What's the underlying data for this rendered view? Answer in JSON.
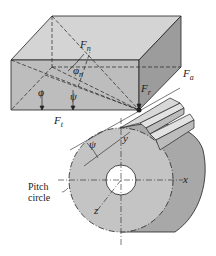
{
  "figure": {
    "type": "helical gear force components diagram",
    "labels": {
      "normal_force": {
        "main": "F",
        "sub": "n"
      },
      "axial_force": {
        "main": "F",
        "sub": "a"
      },
      "radial_force": {
        "main": "F",
        "sub": "r"
      },
      "tangential_force": {
        "main": "F",
        "sub": "t"
      },
      "normal_pressure_angle": {
        "main": "φ",
        "sub": "n"
      },
      "pressure_angle": "φ",
      "helix_angle_box": "ψ",
      "helix_angle_gear": "ψ",
      "axis_x": "x",
      "axis_y": "y",
      "axis_z": "z",
      "pitch_circle_line1": "Pitch",
      "pitch_circle_line2": "circle"
    },
    "colors": {
      "box_top": "#d4d4d4",
      "box_front": "#bdbdbd",
      "box_right": "#9c9c9c",
      "gear_face": "#c4c4c4",
      "gear_side": "#a8a8a8",
      "line": "#222222"
    }
  }
}
